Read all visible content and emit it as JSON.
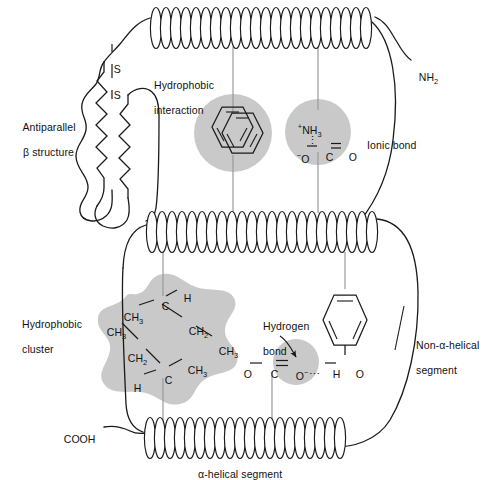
{
  "figure": {
    "background_color": "#ffffff",
    "line_color": "#1a1a1a",
    "shade_color": "#c9c9c9",
    "leader_color": "#9a9a9a"
  },
  "labels": {
    "antiparallel": {
      "line1": "Antiparallel",
      "line2": "β structure"
    },
    "hydrophobic_interaction": {
      "line1": "Hydrophobic",
      "line2": "interaction"
    },
    "ionic_bond": {
      "line1": "Ionic bond"
    },
    "hydrophobic_cluster": {
      "line1": "Hydrophobic",
      "line2": "cluster"
    },
    "hydrogen_bond": {
      "line1": "Hydrogen",
      "line2": "bond"
    },
    "non_helical": {
      "line1": "Non-α-helical",
      "line2": "segment"
    },
    "helical_segment": {
      "line1": "α-helical segment"
    },
    "n_terminus": "NH",
    "n_terminus_sub": "2",
    "c_terminus": "COOH",
    "disulfide_top": "S",
    "disulfide_bottom": "S"
  },
  "chemistry": {
    "ionic_bond_group": {
      "cation_sup": "+",
      "cation": "NH",
      "cation_sub": "3",
      "dots": "⋮",
      "anion_sup": "−",
      "anion_o": "O",
      "bond_single": "—",
      "carbon": "C",
      "bond_double": "═",
      "carbonyl_o": "O"
    },
    "hydrogen_bond_group": {
      "o_left": "O",
      "bond_single": "—",
      "carbon": "C",
      "bond_double": "═",
      "o_carbonyl": "O",
      "o_carbonyl_sup": "−",
      "dots": "⋯",
      "hydrogen": "H",
      "o_right": "O"
    },
    "hydrophobic_cluster_atoms": [
      {
        "name": "ch3-upper-left",
        "text": "CH",
        "sub": "3"
      },
      {
        "name": "carbon-upper",
        "text": "C",
        "sub": ""
      },
      {
        "name": "h-upper-right",
        "text": "H",
        "sub": ""
      },
      {
        "name": "ch2-upper-right",
        "text": "CH",
        "sub": "2"
      },
      {
        "name": "ch3-right",
        "text": "CH",
        "sub": "3"
      },
      {
        "name": "ch3-left",
        "text": "CH",
        "sub": "3"
      },
      {
        "name": "ch2-lower-left",
        "text": "CH",
        "sub": "2"
      },
      {
        "name": "h-lower-left",
        "text": "H",
        "sub": ""
      },
      {
        "name": "carbon-lower",
        "text": "C",
        "sub": ""
      },
      {
        "name": "ch3-lower-right",
        "text": "CH",
        "sub": "3"
      }
    ],
    "tyrosine_ring": {
      "hydroxyl_h": "H",
      "hydroxyl_o": "O"
    }
  },
  "structure_elements": [
    {
      "name": "alpha-helix-row-1",
      "type": "coil",
      "turns": 21
    },
    {
      "name": "alpha-helix-row-2",
      "type": "coil",
      "turns": 23
    },
    {
      "name": "alpha-helix-row-3",
      "type": "coil",
      "turns": 20
    },
    {
      "name": "antiparallel-beta-sheet",
      "type": "zigzag",
      "strands": 2
    },
    {
      "name": "disulfide-bridge",
      "type": "bond"
    },
    {
      "name": "benzene-ring-pair",
      "type": "aromatic",
      "count": 2
    },
    {
      "name": "phenol-ring",
      "type": "aromatic",
      "count": 1
    }
  ]
}
